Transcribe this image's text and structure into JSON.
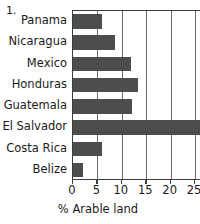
{
  "figure": {
    "number_label": "1.",
    "background_color": "#ffffff",
    "bar_color": "#4d4d4d",
    "axis_color": "#3d3d3d",
    "gridline_color": "#6b6b6b"
  },
  "chart_data": {
    "type": "bar",
    "orientation": "horizontal",
    "title": "",
    "subtitle": "",
    "xlabel": "% Arable land",
    "ylabel": "",
    "categories": [
      "Panama",
      "Nicaragua",
      "Mexico",
      "Honduras",
      "Guatemala",
      "El Salvador",
      "Costa Rica",
      "Belize"
    ],
    "values": [
      6.0,
      8.7,
      11.8,
      13.3,
      12.0,
      27.3,
      6.0,
      2.0
    ],
    "xlim": [
      0,
      30
    ],
    "xticks": [
      0,
      5,
      10,
      15,
      20,
      25,
      30
    ],
    "xtick_labels": [
      "0",
      "5",
      "10",
      "15",
      "20",
      "25",
      "3"
    ],
    "grid": "vertical",
    "legend": "none",
    "annotations": [
      "1."
    ]
  }
}
